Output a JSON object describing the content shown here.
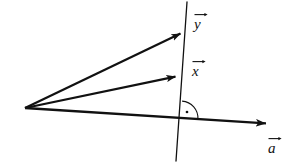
{
  "figure": {
    "kind": "vector-projection-diagram",
    "width": 289,
    "height": 164,
    "background_color": "#ffffff",
    "stroke_color": "#111111"
  },
  "geometry": {
    "origin": {
      "x": 25,
      "y": 108
    },
    "vectors": [
      {
        "id": "y",
        "label": "y",
        "from": {
          "x": 25,
          "y": 108
        },
        "to": {
          "x": 188,
          "y": 30
        },
        "stroke_width": 2.2,
        "arrowhead": true
      },
      {
        "id": "x",
        "label": "x",
        "from": {
          "x": 25,
          "y": 108
        },
        "to": {
          "x": 184,
          "y": 75
        },
        "stroke_width": 2.2,
        "arrowhead": true
      },
      {
        "id": "a",
        "label": "a",
        "from": {
          "x": 25,
          "y": 108
        },
        "to": {
          "x": 276,
          "y": 124
        },
        "stroke_width": 2.4,
        "arrowhead": true
      }
    ],
    "line": {
      "id": "subspace-line",
      "from": {
        "x": 187,
        "y": 2
      },
      "to": {
        "x": 176,
        "y": 161
      },
      "stroke_width": 1.3
    },
    "right_angle_marker": {
      "vertex": {
        "x": 181,
        "y": 118
      },
      "radius": 17,
      "dot_offset": {
        "x": 6,
        "y": -6
      },
      "dot_radius": 1.3,
      "stroke_width": 1.1
    }
  },
  "labels": {
    "y": {
      "text": "y",
      "accent": "vector-arrow"
    },
    "x": {
      "text": "x",
      "accent": "vector-arrow"
    },
    "a": {
      "text": "a",
      "accent": "vector-arrow"
    }
  }
}
